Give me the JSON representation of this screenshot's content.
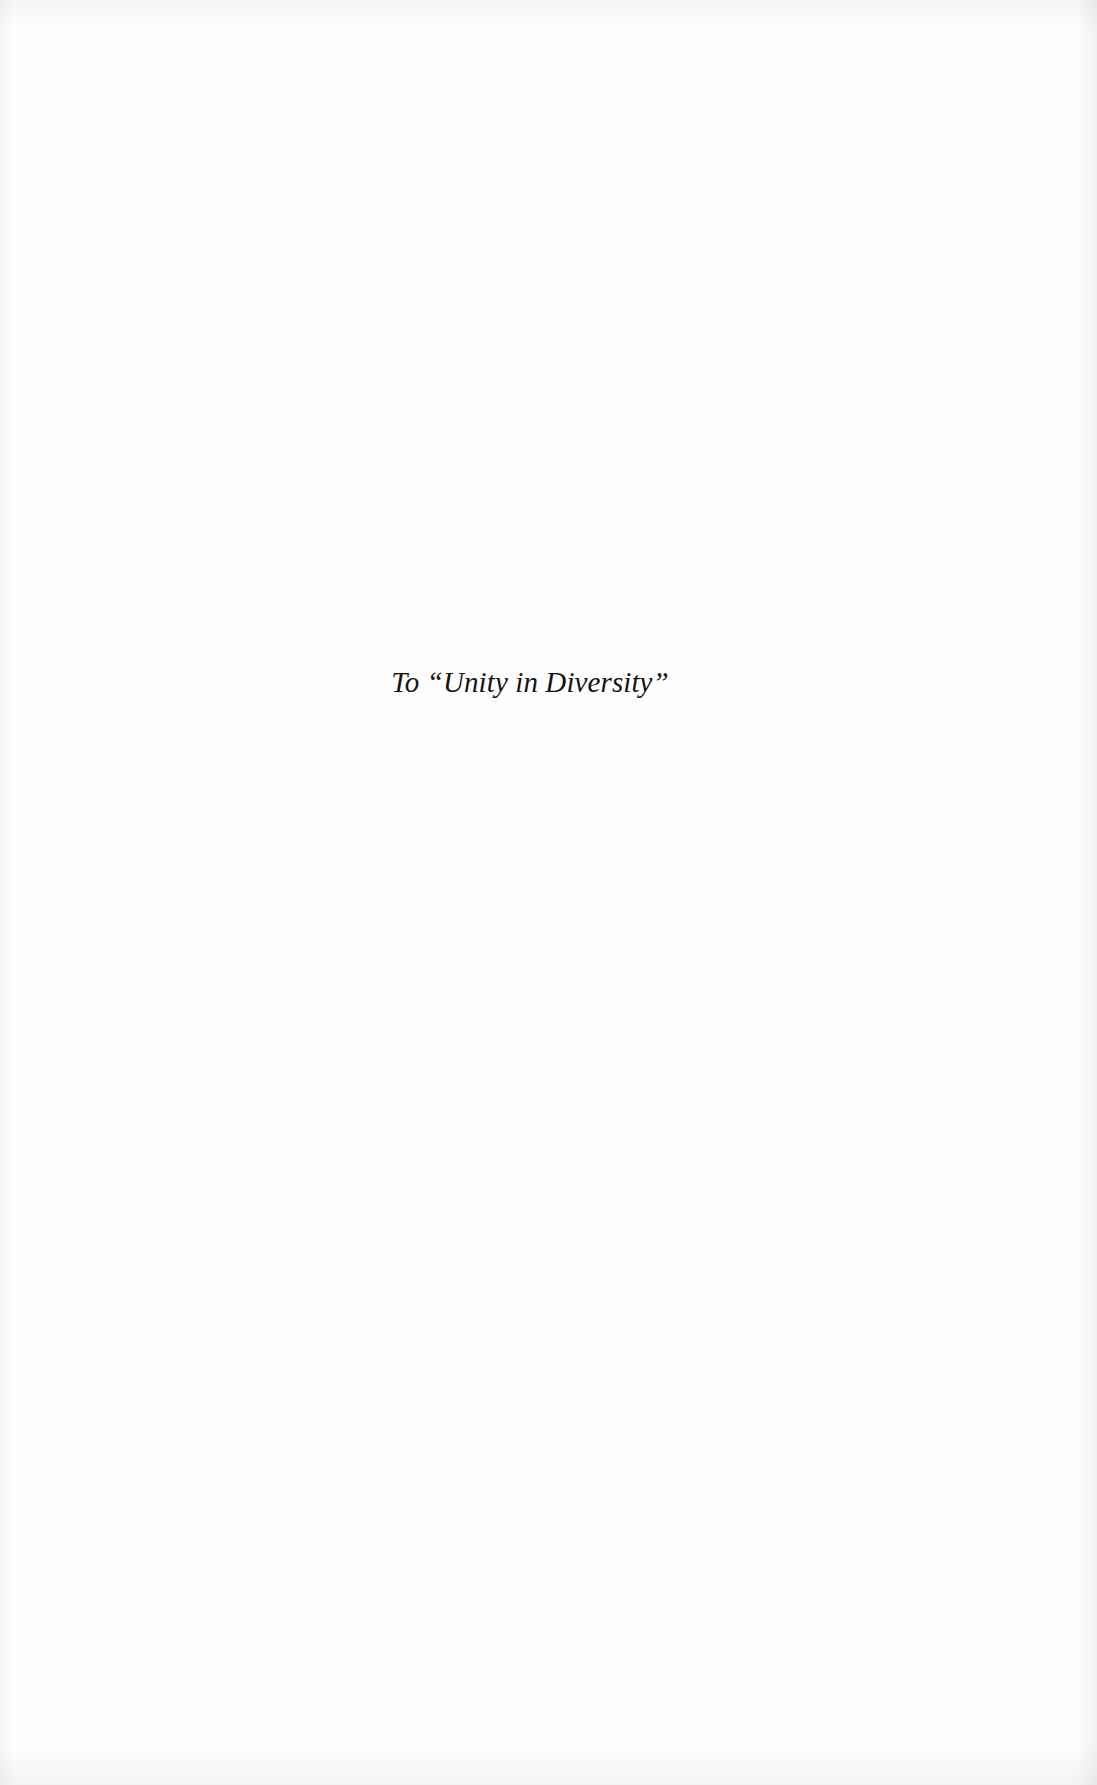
{
  "page": {
    "type": "dedication",
    "dedication_text": "To “Unity in Diversity”",
    "colors": {
      "background": "#fefefe",
      "text": "#141414"
    }
  }
}
